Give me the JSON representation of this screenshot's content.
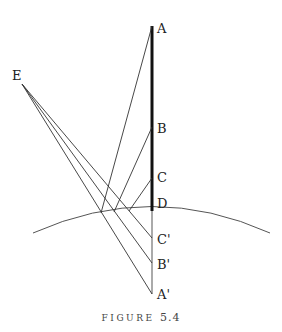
{
  "figure": {
    "caption_word": "FIGURE",
    "caption_number": "5.4"
  },
  "labels": {
    "A": "A",
    "B": "B",
    "C": "C",
    "D": "D",
    "E": "E",
    "C_prime": "C'",
    "B_prime": "B'",
    "A_prime": "A'"
  },
  "colors": {
    "line": "#333333",
    "thick_line": "#111111",
    "image_line": "#aaaaaa",
    "arc": "#555555"
  }
}
